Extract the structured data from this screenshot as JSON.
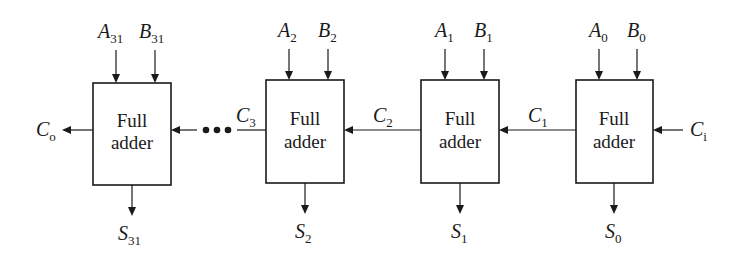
{
  "diagram": {
    "colors": {
      "stroke": "#1a1a1a",
      "background": "#ffffff"
    },
    "adders": [
      {
        "id": "fa31",
        "line1": "Full",
        "line2": "adder",
        "a": {
          "base": "A",
          "sub": "31"
        },
        "b": {
          "base": "B",
          "sub": "31"
        },
        "s": {
          "base": "S",
          "sub": "31"
        }
      },
      {
        "id": "fa2",
        "line1": "Full",
        "line2": "adder",
        "a": {
          "base": "A",
          "sub": "2"
        },
        "b": {
          "base": "B",
          "sub": "2"
        },
        "s": {
          "base": "S",
          "sub": "2"
        }
      },
      {
        "id": "fa1",
        "line1": "Full",
        "line2": "adder",
        "a": {
          "base": "A",
          "sub": "1"
        },
        "b": {
          "base": "B",
          "sub": "1"
        },
        "s": {
          "base": "S",
          "sub": "1"
        }
      },
      {
        "id": "fa0",
        "line1": "Full",
        "line2": "adder",
        "a": {
          "base": "A",
          "sub": "0"
        },
        "b": {
          "base": "B",
          "sub": "0"
        },
        "s": {
          "base": "S",
          "sub": "0"
        }
      }
    ],
    "carries": {
      "co": {
        "base": "C",
        "sub": "o"
      },
      "c3": {
        "base": "C",
        "sub": "3"
      },
      "c2": {
        "base": "C",
        "sub": "2"
      },
      "c1": {
        "base": "C",
        "sub": "1"
      },
      "ci": {
        "base": "C",
        "sub": "i"
      }
    },
    "ellipsis": "•••"
  }
}
